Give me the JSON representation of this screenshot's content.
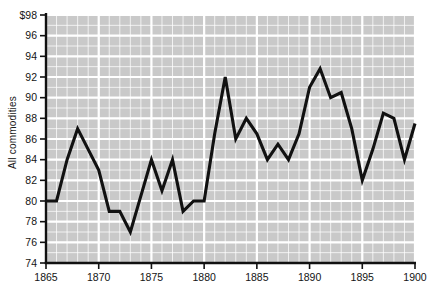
{
  "chart_data": {
    "type": "line",
    "title": "",
    "subtitle": "",
    "xlabel": "",
    "ylabel": "All commodities",
    "xlim": [
      1865,
      1900
    ],
    "ylim": [
      74,
      98
    ],
    "grid": true,
    "legend": "none",
    "y_tick_labels": [
      "$98",
      "96",
      "94",
      "92",
      "90",
      "88",
      "86",
      "84",
      "82",
      "80",
      "78",
      "76",
      "74"
    ],
    "y_ticks": [
      98,
      96,
      94,
      92,
      90,
      88,
      86,
      84,
      82,
      80,
      78,
      76,
      74
    ],
    "x_tick_labels": [
      "1865",
      "1870",
      "1875",
      "1880",
      "1885",
      "1890",
      "1895",
      "1900"
    ],
    "x_ticks": [
      1865,
      1870,
      1875,
      1880,
      1885,
      1890,
      1895,
      1900
    ],
    "x": [
      1865,
      1866,
      1867,
      1868,
      1869,
      1870,
      1871,
      1872,
      1873,
      1874,
      1875,
      1876,
      1877,
      1878,
      1879,
      1880,
      1881,
      1882,
      1883,
      1884,
      1885,
      1886,
      1887,
      1888,
      1889,
      1890,
      1891,
      1892,
      1893,
      1894,
      1895,
      1896,
      1897,
      1898,
      1899,
      1900
    ],
    "values": [
      80.0,
      80.0,
      84.0,
      87.0,
      85.0,
      83.0,
      79.0,
      79.0,
      77.0,
      80.5,
      84.0,
      81.0,
      84.0,
      79.0,
      80.0,
      80.0,
      86.5,
      92.0,
      86.0,
      88.0,
      86.5,
      84.0,
      85.5,
      84.0,
      86.5,
      91.0,
      92.8,
      90.0,
      90.5,
      87.0,
      82.0,
      85.0,
      88.5,
      88.0,
      84.0,
      87.5
    ],
    "series": [
      {
        "name": "All commodities",
        "color": "#111111",
        "values": [
          80.0,
          80.0,
          84.0,
          87.0,
          85.0,
          83.0,
          79.0,
          79.0,
          77.0,
          80.5,
          84.0,
          81.0,
          84.0,
          79.0,
          80.0,
          80.0,
          86.5,
          92.0,
          86.0,
          88.0,
          86.5,
          84.0,
          85.5,
          84.0,
          86.5,
          91.0,
          92.8,
          90.0,
          90.5,
          87.0,
          82.0,
          85.0,
          88.5,
          88.0,
          84.0,
          87.5
        ]
      }
    ],
    "style": {
      "plot_background": "#c9c9c9",
      "gridline_color": "#ffffff",
      "line_color": "#111111",
      "axis_color": "#111111",
      "page_background": "#ffffff"
    }
  }
}
